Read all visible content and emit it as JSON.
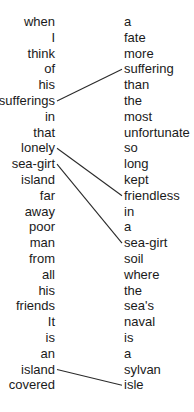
{
  "left_words": [
    "when",
    "I",
    "think",
    "of",
    "his",
    "sufferings",
    "in",
    "that",
    "lonely",
    "sea-girt",
    "island",
    "far",
    "away",
    "poor",
    "man",
    "from",
    "all",
    "his",
    "friends",
    "It",
    "is",
    "an",
    "island",
    "covered"
  ],
  "right_words": [
    "a",
    "fate",
    "more",
    "suffering",
    "than",
    "the",
    "most",
    "unfortunate",
    "so",
    "long",
    "kept",
    "friendless",
    "in",
    "a",
    "sea-girt",
    "soil",
    "where",
    "the",
    "sea's",
    "naval",
    "is",
    "a",
    "sylvan",
    "isle"
  ],
  "links": [
    {
      "left_index": 5,
      "left_word": "sufferings",
      "right_index": 3,
      "right_word": "suffering"
    },
    {
      "left_index": 8,
      "left_word": "lonely",
      "right_index": 11,
      "right_word": "friendless"
    },
    {
      "left_index": 9,
      "left_word": "sea-girt",
      "right_index": 14,
      "right_word": "sea-girt"
    },
    {
      "left_index": 22,
      "left_word": "island",
      "right_index": 23,
      "right_word": "isle"
    }
  ],
  "colors": {
    "text": "#1a1a1a",
    "line": "#2a2a2a",
    "background": "#ffffff"
  }
}
